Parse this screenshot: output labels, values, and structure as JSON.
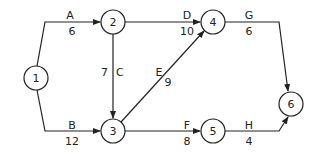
{
  "diagram": {
    "type": "activity-network",
    "nodes": [
      {
        "id": "1",
        "label": "1",
        "x": 36,
        "y": 78
      },
      {
        "id": "2",
        "label": "2",
        "x": 113,
        "y": 22
      },
      {
        "id": "3",
        "label": "3",
        "x": 113,
        "y": 131
      },
      {
        "id": "4",
        "label": "4",
        "x": 213,
        "y": 22
      },
      {
        "id": "5",
        "label": "5",
        "x": 213,
        "y": 131
      },
      {
        "id": "6",
        "label": "6",
        "x": 291,
        "y": 104
      }
    ],
    "edges": [
      {
        "from": "1",
        "to": "2",
        "activity": "A",
        "duration": "6"
      },
      {
        "from": "1",
        "to": "3",
        "activity": "B",
        "duration": "12"
      },
      {
        "from": "2",
        "to": "3",
        "activity": "C",
        "duration": "7"
      },
      {
        "from": "2",
        "to": "4",
        "activity": "D",
        "duration": "10"
      },
      {
        "from": "3",
        "to": "4",
        "activity": "E",
        "duration": "9"
      },
      {
        "from": "3",
        "to": "5",
        "activity": "F",
        "duration": "8"
      },
      {
        "from": "4",
        "to": "6",
        "activity": "G",
        "duration": "6"
      },
      {
        "from": "5",
        "to": "6",
        "activity": "H",
        "duration": "4"
      }
    ]
  }
}
